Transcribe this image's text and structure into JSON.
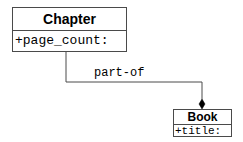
{
  "diagram": {
    "type": "uml-class",
    "classes": [
      {
        "name": "Chapter",
        "attributes": [
          "+page_count:"
        ]
      },
      {
        "name": "Book",
        "attributes": [
          "+title:"
        ]
      }
    ],
    "association": {
      "label": "part-of",
      "from": "Chapter",
      "to": "Book",
      "kind": "composition",
      "diamond_end": "Book"
    },
    "colors": {
      "line": "#4a4a4a",
      "text": "#000000",
      "background": "#ffffff"
    }
  }
}
